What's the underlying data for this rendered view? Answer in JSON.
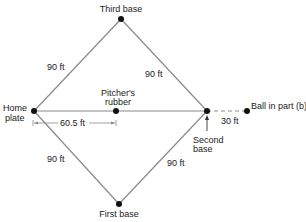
{
  "diagram": {
    "type": "baseball-diamond",
    "colors": {
      "line": "#8a8a8a",
      "point": "#111111",
      "text": "#1a1a1a"
    },
    "points": {
      "home_plate": {
        "label_line1": "Home",
        "label_line2": "plate",
        "x": 34,
        "y": 111
      },
      "pitchers_rubber": {
        "label_line1": "Pitcher's",
        "label_line2": "rubber",
        "x": 116,
        "y": 111
      },
      "second_base": {
        "label_line1": "Second",
        "label_line2": "base",
        "x": 207,
        "y": 111
      },
      "third_base": {
        "label": "Third base",
        "x": 121,
        "y": 19
      },
      "first_base": {
        "label": "First base",
        "x": 119,
        "y": 204
      },
      "ball": {
        "label": "Ball in part (b)",
        "x": 247,
        "y": 111
      }
    },
    "distances": {
      "home_to_third": "90 ft",
      "third_to_second": "90 ft",
      "home_to_first": "90 ft",
      "first_to_second": "90 ft",
      "home_to_pitcher": "60.5 ft",
      "second_to_ball": "30 ft"
    }
  }
}
